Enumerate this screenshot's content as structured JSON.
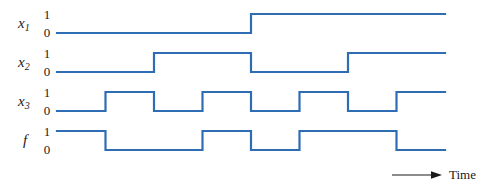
{
  "figure": {
    "background_color": "#ffffff",
    "wave_color": "#2E6DB4",
    "axis_color": "#1a1a1a"
  },
  "axis": {
    "time_label": "Time",
    "arrow_icon": "right-arrow-icon"
  },
  "levels": {
    "high": "1",
    "low": "0"
  },
  "signals": [
    {
      "name": "x1",
      "label": "x",
      "subscript": "1"
    },
    {
      "name": "x2",
      "label": "x",
      "subscript": "2"
    },
    {
      "name": "x3",
      "label": "x",
      "subscript": "3"
    },
    {
      "name": "f",
      "label": "f",
      "subscript": ""
    }
  ],
  "chart_data": {
    "type": "line",
    "xlabel": "Time",
    "ylabel": "",
    "ylim": [
      0,
      1
    ],
    "grid": false,
    "legend": "none",
    "x": [
      0,
      1,
      2,
      3,
      4,
      5,
      6,
      7
    ],
    "categories": [
      "0",
      "1",
      "2",
      "3",
      "4",
      "5",
      "6",
      "7"
    ],
    "time_slots": 8,
    "series": [
      {
        "name": "x1",
        "values": [
          0,
          0,
          0,
          0,
          1,
          1,
          1,
          1
        ]
      },
      {
        "name": "x2",
        "values": [
          0,
          0,
          1,
          1,
          0,
          0,
          1,
          1
        ]
      },
      {
        "name": "x3",
        "values": [
          0,
          1,
          0,
          1,
          0,
          1,
          0,
          1
        ]
      },
      {
        "name": "f",
        "values": [
          1,
          0,
          0,
          1,
          0,
          1,
          1,
          0
        ]
      }
    ]
  },
  "geometry": {
    "plot_left": 57,
    "plot_right": 445,
    "slot_width": 48.5,
    "row_tops": [
      12,
      51,
      90,
      129
    ],
    "row_high_y": [
      14,
      53,
      92,
      131
    ],
    "row_low_y": [
      33,
      72,
      111,
      150
    ],
    "label_x": 18,
    "level_x": 41,
    "stroke_width": 2.2
  }
}
